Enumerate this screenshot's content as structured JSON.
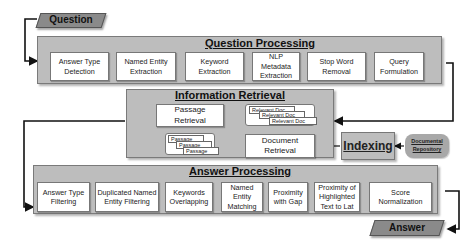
{
  "question": {
    "label": "Question"
  },
  "answer": {
    "label": "Answer"
  },
  "question_processing": {
    "title": "Question Processing",
    "steps": [
      {
        "label": "Answer Type Detection"
      },
      {
        "label": "Named Entity Extraction"
      },
      {
        "label": "Keyword Extraction"
      },
      {
        "label": "NLP Metadata Extraction"
      },
      {
        "label": "Stop Word Removal"
      },
      {
        "label": "Query Formulation"
      }
    ]
  },
  "information_retrieval": {
    "title": "Information Retrieval",
    "passage_retrieval": "Passage Retrieval",
    "document_retrieval": "Document Retrieval",
    "passages": [
      "Passage",
      "Passage",
      "Passage"
    ],
    "relevant_docs": [
      "Relevant Doc",
      "Relevant Doc",
      "Relevant Doc"
    ]
  },
  "indexing": {
    "label": "Indexing"
  },
  "documental_repository": {
    "label": "Documental Repository"
  },
  "answer_processing": {
    "title": "Answer Processing",
    "steps": [
      {
        "label": "Answer Type Filtering"
      },
      {
        "label": "Duplicated Named Entity Filtering"
      },
      {
        "label": "Keywords Overlapping"
      },
      {
        "label": "Named Entity Matching"
      },
      {
        "label": "Proximity with Gap"
      },
      {
        "label": "Proximity of Highlighted Text to Lat"
      },
      {
        "label": "Score Normalization"
      }
    ]
  },
  "colors": {
    "panel": "#bdbdbd",
    "io_shape": "#8a8a8a",
    "box": "#ffffff",
    "wire": "#111111"
  }
}
